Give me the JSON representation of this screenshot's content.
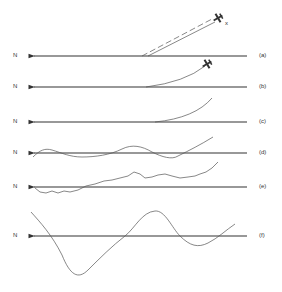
{
  "diagram": {
    "rows": [
      {
        "id": "a",
        "direction_label": "N",
        "tag": "(a)",
        "y": 56
      },
      {
        "id": "b",
        "direction_label": "N",
        "tag": "(b)",
        "y": 87
      },
      {
        "id": "c",
        "direction_label": "N",
        "tag": "(c)",
        "y": 122
      },
      {
        "id": "d",
        "direction_label": "N",
        "tag": "(d)",
        "y": 153
      },
      {
        "id": "e",
        "direction_label": "N",
        "tag": "(e)",
        "y": 187
      },
      {
        "id": "f",
        "direction_label": "N",
        "tag": "(f)",
        "y": 236
      }
    ],
    "target_marker": "x",
    "colors": {
      "line": "#333333",
      "curve": "#555555"
    }
  }
}
